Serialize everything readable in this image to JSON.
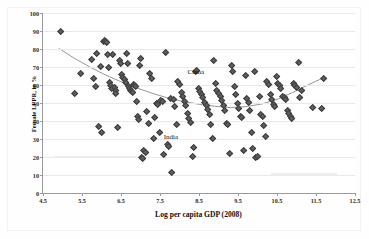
{
  "figure": {
    "faint_header": "",
    "background_color": "#ffffff",
    "marker_color": "#5e5e5e",
    "curve_color": "#8a8a8a",
    "grid_color": "#e9e9e9",
    "axis_color": "#9a9a9a"
  },
  "chart_data": {
    "type": "scatter",
    "title": "",
    "xlabel": "Log per capita GDP (2008)",
    "ylabel": "Female LFPR, in %",
    "xlim": [
      4.5,
      12.5
    ],
    "ylim": [
      0,
      100
    ],
    "xticks": [
      4.5,
      5.5,
      6.5,
      7.5,
      8.5,
      9.5,
      10.5,
      11.5,
      12.5
    ],
    "yticks": [
      0,
      10,
      20,
      30,
      40,
      50,
      60,
      70,
      80,
      90,
      100
    ],
    "grid": "horizontal",
    "legend": "none",
    "annotations": [
      {
        "label": "China",
        "x": 8.42,
        "y": 67.5
      },
      {
        "label": "India",
        "x": 7.78,
        "y": 31.0
      }
    ],
    "series": [
      {
        "name": "Countries",
        "marker": "diamond",
        "color": "#5e5e5e",
        "points": [
          [
            4.92,
            90.4
          ],
          [
            5.28,
            55.6
          ],
          [
            5.45,
            66.8
          ],
          [
            5.73,
            74.8
          ],
          [
            5.78,
            63.9
          ],
          [
            5.82,
            59.6
          ],
          [
            5.86,
            78.2
          ],
          [
            5.9,
            37.6
          ],
          [
            5.95,
            70.5
          ],
          [
            5.97,
            33.8
          ],
          [
            6.02,
            84.8
          ],
          [
            6.06,
            85.2
          ],
          [
            6.09,
            84.6
          ],
          [
            6.12,
            84.3
          ],
          [
            6.14,
            77.6
          ],
          [
            6.16,
            70.3
          ],
          [
            6.18,
            61.8
          ],
          [
            6.2,
            60.2
          ],
          [
            6.23,
            58.6
          ],
          [
            6.27,
            77.5
          ],
          [
            6.3,
            59.1
          ],
          [
            6.33,
            57.4
          ],
          [
            6.35,
            55.6
          ],
          [
            6.38,
            36.9
          ],
          [
            6.44,
            73.8
          ],
          [
            6.47,
            72.6
          ],
          [
            6.5,
            66.3
          ],
          [
            6.53,
            64.8
          ],
          [
            6.56,
            63.5
          ],
          [
            6.59,
            62.1
          ],
          [
            6.62,
            78.1
          ],
          [
            6.65,
            72.2
          ],
          [
            6.68,
            59.4
          ],
          [
            6.7,
            58.3
          ],
          [
            6.72,
            57.6
          ],
          [
            6.75,
            57.0
          ],
          [
            6.78,
            56.4
          ],
          [
            6.8,
            60.8
          ],
          [
            6.82,
            60.1
          ],
          [
            6.85,
            59.5
          ],
          [
            6.88,
            51.4
          ],
          [
            6.9,
            43.1
          ],
          [
            6.93,
            41.2
          ],
          [
            6.95,
            71.3
          ],
          [
            6.98,
            75.2
          ],
          [
            7.0,
            20.0
          ],
          [
            7.02,
            19.4
          ],
          [
            7.06,
            24.2
          ],
          [
            7.1,
            23.2
          ],
          [
            7.14,
            45.9
          ],
          [
            7.18,
            38.8
          ],
          [
            7.22,
            66.8
          ],
          [
            7.26,
            64.1
          ],
          [
            7.3,
            30.9
          ],
          [
            7.34,
            42.5
          ],
          [
            7.38,
            50.4
          ],
          [
            7.42,
            49.7
          ],
          [
            7.46,
            34.2
          ],
          [
            7.5,
            51.9
          ],
          [
            7.54,
            51.2
          ],
          [
            7.58,
            22.1
          ],
          [
            7.62,
            78.7
          ],
          [
            7.66,
            27.6
          ],
          [
            7.7,
            26.4
          ],
          [
            7.74,
            53.0
          ],
          [
            7.78,
            11.6
          ],
          [
            7.82,
            52.4
          ],
          [
            7.86,
            48.6
          ],
          [
            7.9,
            38.3
          ],
          [
            7.94,
            62.4
          ],
          [
            7.98,
            60.8
          ],
          [
            8.02,
            56.3
          ],
          [
            8.06,
            54.2
          ],
          [
            8.1,
            51.3
          ],
          [
            8.14,
            48.9
          ],
          [
            8.18,
            44.6
          ],
          [
            8.22,
            41.9
          ],
          [
            8.26,
            39.6
          ],
          [
            8.3,
            21.0
          ],
          [
            8.34,
            25.8
          ],
          [
            8.38,
            67.9
          ],
          [
            8.42,
            68.6
          ],
          [
            8.46,
            58.4
          ],
          [
            8.5,
            56.9
          ],
          [
            8.54,
            55.1
          ],
          [
            8.58,
            53.4
          ],
          [
            8.62,
            51.0
          ],
          [
            8.66,
            49.2
          ],
          [
            8.7,
            47.1
          ],
          [
            8.74,
            44.3
          ],
          [
            8.78,
            38.4
          ],
          [
            8.82,
            30.9
          ],
          [
            8.86,
            74.1
          ],
          [
            8.9,
            61.1
          ],
          [
            8.94,
            57.6
          ],
          [
            8.98,
            55.9
          ],
          [
            9.02,
            53.8
          ],
          [
            9.06,
            51.6
          ],
          [
            9.1,
            49.1
          ],
          [
            9.14,
            46.5
          ],
          [
            9.18,
            39.3
          ],
          [
            9.22,
            38.6
          ],
          [
            9.26,
            22.3
          ],
          [
            9.3,
            71.2
          ],
          [
            9.34,
            68.2
          ],
          [
            9.38,
            59.7
          ],
          [
            9.42,
            55.2
          ],
          [
            9.46,
            50.1
          ],
          [
            9.5,
            47.3
          ],
          [
            9.54,
            43.2
          ],
          [
            9.58,
            42.5
          ],
          [
            9.62,
            24.0
          ],
          [
            9.66,
            65.9
          ],
          [
            9.7,
            52.7
          ],
          [
            9.74,
            51.0
          ],
          [
            9.78,
            46.2
          ],
          [
            9.82,
            33.9
          ],
          [
            9.86,
            25.1
          ],
          [
            9.9,
            68.1
          ],
          [
            9.94,
            20.1
          ],
          [
            9.98,
            20.5
          ],
          [
            10.02,
            53.8
          ],
          [
            10.06,
            44.1
          ],
          [
            10.1,
            42.8
          ],
          [
            10.14,
            38.0
          ],
          [
            10.18,
            32.1
          ],
          [
            10.22,
            62.3
          ],
          [
            10.26,
            60.6
          ],
          [
            10.3,
            55.0
          ],
          [
            10.34,
            52.2
          ],
          [
            10.38,
            49.4
          ],
          [
            10.42,
            48.6
          ],
          [
            10.46,
            65.0
          ],
          [
            10.5,
            61.4
          ],
          [
            10.54,
            60.2
          ],
          [
            10.58,
            58.7
          ],
          [
            10.62,
            54.1
          ],
          [
            10.66,
            53.3
          ],
          [
            10.7,
            52.5
          ],
          [
            10.74,
            46.1
          ],
          [
            10.78,
            44.8
          ],
          [
            10.82,
            43.2
          ],
          [
            10.86,
            41.6
          ],
          [
            10.9,
            61.3
          ],
          [
            10.94,
            60.4
          ],
          [
            10.98,
            59.2
          ],
          [
            11.02,
            72.9
          ],
          [
            11.06,
            53.6
          ],
          [
            11.1,
            57.2
          ],
          [
            11.38,
            48.1
          ],
          [
            11.62,
            47.3
          ],
          [
            11.68,
            64.0
          ]
        ]
      }
    ],
    "fit_curve": {
      "name": "Fitted quadratic trend",
      "color": "#8a8a8a",
      "points": [
        [
          4.9,
          80.4
        ],
        [
          5.3,
          74.9
        ],
        [
          5.7,
          70.0
        ],
        [
          6.1,
          65.6
        ],
        [
          6.5,
          61.8
        ],
        [
          6.9,
          58.4
        ],
        [
          7.3,
          55.4
        ],
        [
          7.7,
          52.8
        ],
        [
          8.1,
          50.8
        ],
        [
          8.5,
          49.3
        ],
        [
          8.9,
          48.2
        ],
        [
          9.3,
          47.4
        ],
        [
          9.7,
          48.0
        ],
        [
          10.1,
          49.4
        ],
        [
          10.5,
          52.0
        ],
        [
          10.9,
          55.8
        ],
        [
          11.3,
          60.1
        ],
        [
          11.7,
          64.1
        ]
      ]
    },
    "artifacts": [
      {
        "name": "smudge-left",
        "x1": 4.75,
        "x2": 7.05,
        "y": 20.0
      },
      {
        "name": "smudge-right",
        "x1": 10.35,
        "x2": 12.05,
        "y": 10.3
      }
    ]
  }
}
